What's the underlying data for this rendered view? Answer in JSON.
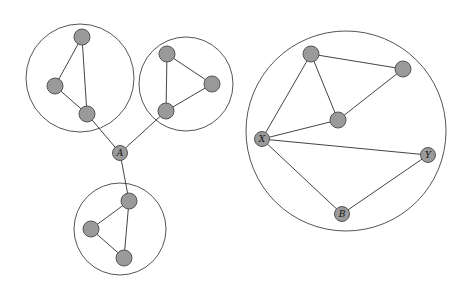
{
  "diagram": {
    "colors": {
      "node_fill": "#9a9a9a",
      "node_stroke": "#555555",
      "edge": "#444444",
      "cluster_stroke": "#555555"
    },
    "clusters": [
      {
        "id": "c1",
        "nodes": [
          "n1",
          "n2",
          "n3"
        ]
      },
      {
        "id": "c2",
        "nodes": [
          "n4",
          "n5",
          "n6"
        ]
      },
      {
        "id": "c3",
        "nodes": [
          "n7",
          "n8",
          "n9"
        ]
      },
      {
        "id": "c4",
        "nodes": [
          "n10",
          "n11",
          "n12",
          "X",
          "Y",
          "B"
        ]
      }
    ],
    "nodes": [
      {
        "id": "n1",
        "label": ""
      },
      {
        "id": "n2",
        "label": ""
      },
      {
        "id": "n3",
        "label": ""
      },
      {
        "id": "n4",
        "label": ""
      },
      {
        "id": "n5",
        "label": ""
      },
      {
        "id": "n6",
        "label": ""
      },
      {
        "id": "A",
        "label": "A"
      },
      {
        "id": "n7",
        "label": ""
      },
      {
        "id": "n8",
        "label": ""
      },
      {
        "id": "n9",
        "label": ""
      },
      {
        "id": "n10",
        "label": ""
      },
      {
        "id": "n11",
        "label": ""
      },
      {
        "id": "n12",
        "label": ""
      },
      {
        "id": "X",
        "label": "X"
      },
      {
        "id": "Y",
        "label": "Y"
      },
      {
        "id": "B",
        "label": "B"
      }
    ],
    "edges": [
      [
        "n1",
        "n2"
      ],
      [
        "n1",
        "n3"
      ],
      [
        "n2",
        "n3"
      ],
      [
        "n4",
        "n5"
      ],
      [
        "n4",
        "n6"
      ],
      [
        "n5",
        "n6"
      ],
      [
        "n3",
        "A"
      ],
      [
        "n6",
        "A"
      ],
      [
        "A",
        "n7"
      ],
      [
        "n7",
        "n8"
      ],
      [
        "n7",
        "n9"
      ],
      [
        "n8",
        "n9"
      ],
      [
        "n10",
        "n11"
      ],
      [
        "n10",
        "n12"
      ],
      [
        "n11",
        "n12"
      ],
      [
        "n10",
        "X"
      ],
      [
        "n12",
        "X"
      ],
      [
        "X",
        "Y"
      ],
      [
        "X",
        "B"
      ],
      [
        "Y",
        "B"
      ]
    ]
  }
}
